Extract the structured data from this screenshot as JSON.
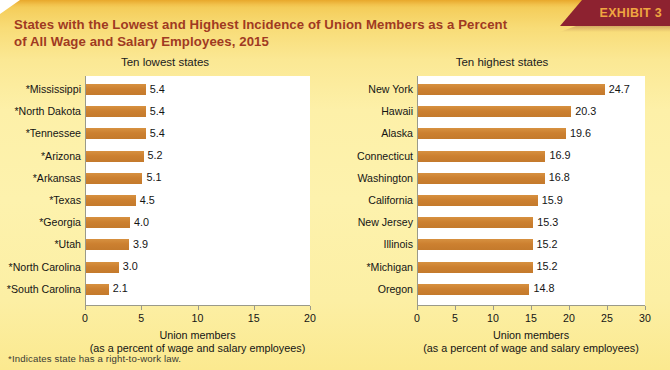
{
  "exhibit": {
    "label": "EXHIBIT 3"
  },
  "title": {
    "line1": "States with the Lowest and Highest Incidence of Union Members as a Percent",
    "line2": "of All Wage and Salary Employees, 2015"
  },
  "footnote": "*Indicates state has a right-to-work law.",
  "colors": {
    "bar": "#cc8030",
    "title_text": "#a03a22",
    "ribbon_bg": "#8d2230",
    "ribbon_text": "#f0a641",
    "plot_bg": "#ffffff",
    "background_top": "#f0c24a",
    "background_bottom": "#fbe98f"
  },
  "chart_data": [
    {
      "type": "bar",
      "orientation": "horizontal",
      "title": "Ten lowest states",
      "xlabel": "Union members",
      "xlabel2": "(as a percent of wage and salary employees)",
      "ylabel": "",
      "xlim": [
        0,
        20
      ],
      "xticks": [
        0,
        5,
        10,
        15,
        20
      ],
      "grid": false,
      "legend": "none",
      "categories": [
        "*Mississippi",
        "*North Dakota",
        "*Tennessee",
        "*Arizona",
        "*Arkansas",
        "*Texas",
        "*Georgia",
        "*Utah",
        "*North Carolina",
        "*South Carolina"
      ],
      "values": [
        5.4,
        5.4,
        5.4,
        5.2,
        5.1,
        4.5,
        4.0,
        3.9,
        3.0,
        2.1
      ],
      "value_labels": [
        "5.4",
        "5.4",
        "5.4",
        "5.2",
        "5.1",
        "4.5",
        "4.0",
        "3.9",
        "3.0",
        "2.1"
      ]
    },
    {
      "type": "bar",
      "orientation": "horizontal",
      "title": "Ten highest states",
      "xlabel": "Union members",
      "xlabel2": "(as a percent of wage and salary employees)",
      "ylabel": "",
      "xlim": [
        0,
        30
      ],
      "xticks": [
        0,
        5,
        10,
        15,
        20,
        25,
        30
      ],
      "grid": false,
      "legend": "none",
      "categories": [
        "New York",
        "Hawaii",
        "Alaska",
        "Connecticut",
        "Washington",
        "California",
        "New Jersey",
        "Illinois",
        "*Michigan",
        "Oregon"
      ],
      "values": [
        24.7,
        20.3,
        19.6,
        16.9,
        16.8,
        15.9,
        15.3,
        15.2,
        15.2,
        14.8
      ],
      "value_labels": [
        "24.7",
        "20.3",
        "19.6",
        "16.9",
        "16.8",
        "15.9",
        "15.3",
        "15.2",
        "15.2",
        "14.8"
      ]
    }
  ]
}
